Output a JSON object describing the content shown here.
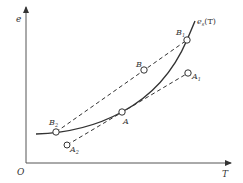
{
  "diagram": {
    "type": "saturation vapor pressure diagram",
    "axes": {
      "origin_label": "O",
      "x_label": "T",
      "y_label": "e"
    },
    "curve": {
      "label_main": "e",
      "label_sub": "s",
      "label_arg": "(T)"
    },
    "points": [
      {
        "id": "B1",
        "label": "B",
        "sub": "1"
      },
      {
        "id": "B",
        "label": "B",
        "sub": ""
      },
      {
        "id": "A1",
        "label": "A",
        "sub": "1"
      },
      {
        "id": "A",
        "label": "A",
        "sub": ""
      },
      {
        "id": "B2",
        "label": "B",
        "sub": "2"
      },
      {
        "id": "A2",
        "label": "A",
        "sub": "2"
      }
    ],
    "lines": [
      {
        "from": "B2",
        "to": "B1",
        "style": "dashed"
      },
      {
        "from": "A2",
        "to": "A1",
        "style": "dashed"
      }
    ],
    "colors": {
      "stroke": "#333333",
      "background": "#ffffff"
    }
  }
}
